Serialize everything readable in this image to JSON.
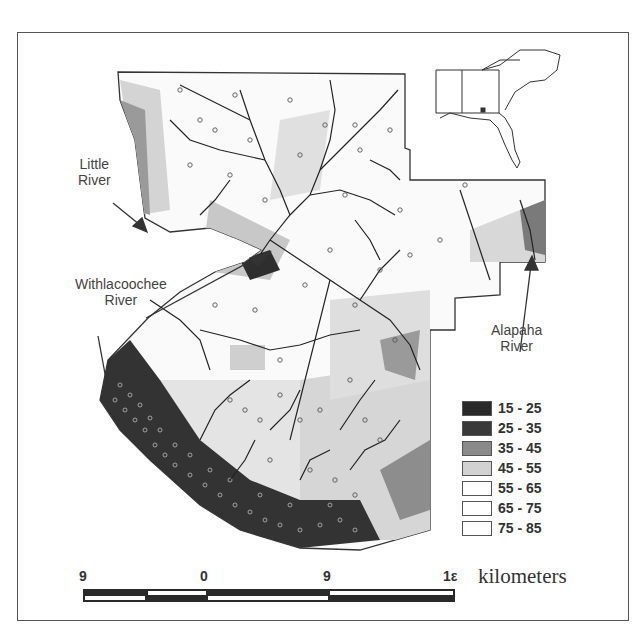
{
  "map": {
    "labels": {
      "little_river": [
        "Little",
        "River"
      ],
      "withlacoochee_river": [
        "Withlacoochee",
        "River"
      ],
      "alapaha_river": [
        "Alapaha",
        "River"
      ]
    },
    "inset": {
      "description": "Southeastern US locator map (Alabama, Georgia, South Carolina, North Carolina, Florida) with study area marked"
    },
    "legend": {
      "items": [
        {
          "label": "15 - 25",
          "color": "#2a2a2a"
        },
        {
          "label": "25 - 35",
          "color": "#3a3a3a"
        },
        {
          "label": "35 - 45",
          "color": "#8a8a8a"
        },
        {
          "label": "45 - 55",
          "color": "#d2d2d2"
        },
        {
          "label": "55 - 65",
          "color": "#ffffff"
        },
        {
          "label": "65 - 75",
          "color": "#ffffff"
        },
        {
          "label": "75 - 85",
          "color": "#ffffff"
        }
      ]
    },
    "scale_bar": {
      "ticks": [
        "9",
        "0",
        "9",
        "18"
      ],
      "tick_display": [
        "9",
        "0",
        "9",
        "1ε"
      ],
      "unit": "kilometers"
    }
  }
}
